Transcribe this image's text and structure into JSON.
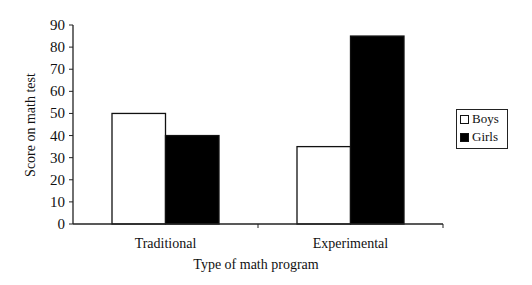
{
  "chart_data": {
    "type": "bar",
    "title": "",
    "xlabel": "Type of math program",
    "ylabel": "Score on math test",
    "ylim": [
      0,
      90
    ],
    "yticks": [
      0,
      10,
      20,
      30,
      40,
      50,
      60,
      70,
      80,
      90
    ],
    "categories": [
      "Traditional",
      "Experimental"
    ],
    "series": [
      {
        "name": "Boys",
        "values": [
          50,
          35
        ],
        "color": "#ffffff"
      },
      {
        "name": "Girls",
        "values": [
          40,
          85
        ],
        "color": "#000000"
      }
    ],
    "grid": false,
    "legend_position": "right"
  }
}
